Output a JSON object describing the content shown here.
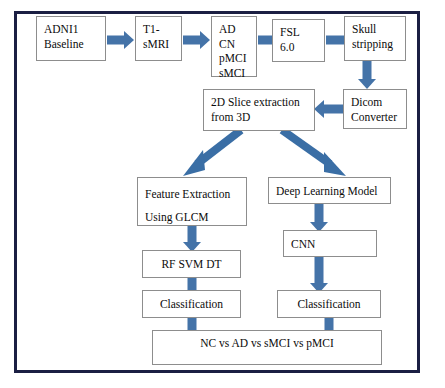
{
  "diagram": {
    "accent_arrow_color": "#4473a8",
    "frame_color": "#1b1f43",
    "box_border_color": "#8d8d8d",
    "nodes": {
      "adni1": "ADNI1\nBaseline",
      "t1smri": "T1-\nsMRI",
      "labels": "AD\nCN\npMCI\nsMCI",
      "fsl": "FSL\n6.0",
      "skull": "Skull\nstripping",
      "dicom": "Dicom\nConverter",
      "slice2d": "2D Slice extraction\nfrom 3D",
      "feature": "Feature Extraction\nUsing GLCM",
      "deep": "Deep Learning Model",
      "classifiers": "RF SVM DT",
      "cnn": "CNN",
      "classification_left": "Classification",
      "classification_right": "Classification",
      "result": "NC vs AD vs sMCI vs pMCI"
    }
  }
}
